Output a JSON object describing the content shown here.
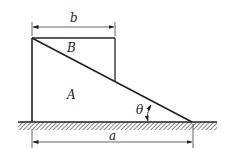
{
  "diagram": {
    "labels": {
      "b": "b",
      "B": "B",
      "A": "A",
      "theta": "θ",
      "a": "a"
    },
    "colors": {
      "line": "#222222",
      "background": "#ffffff"
    },
    "elements": {
      "block_A": "triangular wedge A",
      "block_B": "rectangular block B on incline",
      "ground": "hatched ground surface",
      "dimension_b": "width of block B",
      "dimension_a": "base length of wedge A",
      "angle_theta": "incline angle"
    }
  }
}
